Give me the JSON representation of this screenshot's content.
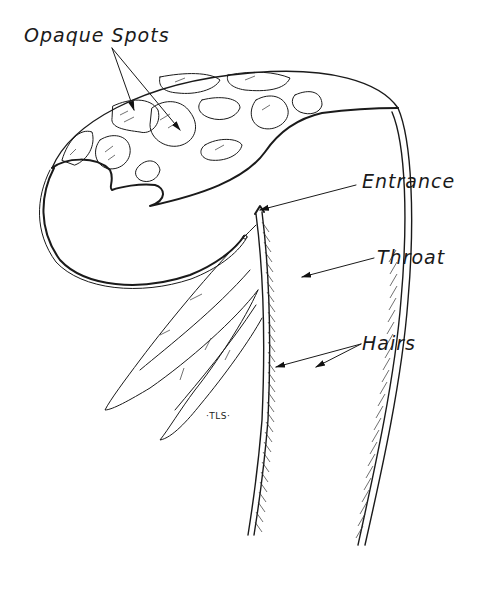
{
  "figure": {
    "labels": {
      "opaque_spots": "Opaque Spots",
      "entrance": "Entrance",
      "throat": "Throat",
      "hairs": "Hairs"
    },
    "signature": "·TLS·",
    "colors": {
      "ink": "#1a1a1a",
      "background": "#ffffff"
    }
  }
}
